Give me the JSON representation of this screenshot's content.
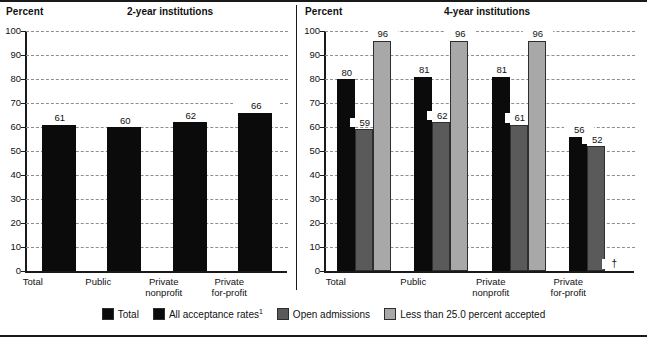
{
  "chart_data": {
    "type": "bar",
    "panels": [
      {
        "key": "two_year",
        "title": "2-year institutions",
        "ylabel": "Percent",
        "ylim": [
          0,
          100
        ],
        "ytick_step": 10,
        "yticks": [
          100,
          90,
          80,
          70,
          60,
          50,
          40,
          30,
          20,
          10,
          0
        ],
        "categories": [
          "Total",
          "Public",
          "Private\nnonprofit",
          "Private\nfor-profit"
        ],
        "series": [
          {
            "name": "Total",
            "color": "#0b0b0b",
            "values": [
              61,
              60,
              62,
              66
            ],
            "labels": [
              "61",
              "60",
              "62",
              "66"
            ]
          }
        ]
      },
      {
        "key": "four_year",
        "title": "4-year institutions",
        "ylabel": "Percent",
        "ylim": [
          0,
          100
        ],
        "ytick_step": 10,
        "yticks": [
          100,
          90,
          80,
          70,
          60,
          50,
          40,
          30,
          20,
          10,
          0
        ],
        "categories": [
          "Total",
          "Public",
          "Private\nnonprofit",
          "Private\nfor-profit"
        ],
        "series": [
          {
            "name": "All acceptance rates",
            "color": "#0b0b0b",
            "values": [
              80,
              81,
              81,
              56
            ],
            "labels": [
              "80",
              "81",
              "81",
              "56"
            ]
          },
          {
            "name": "Open admissions",
            "color": "#5a5a5a",
            "values": [
              59,
              62,
              61,
              52
            ],
            "labels": [
              "59",
              "62",
              "61",
              "52"
            ]
          },
          {
            "name": "Less than 25.0 percent accepted",
            "color": "#a8a8a8",
            "values": [
              96,
              96,
              96,
              null
            ],
            "labels": [
              "96",
              "96",
              "96",
              "†"
            ]
          }
        ]
      }
    ],
    "legend": {
      "position": "bottom",
      "entries": [
        {
          "label": "Total",
          "color": "#0b0b0b",
          "footnote": ""
        },
        {
          "label": "All acceptance rates",
          "color": "#0b0b0b",
          "footnote": "1"
        },
        {
          "label": "Open admissions",
          "color": "#5a5a5a",
          "footnote": ""
        },
        {
          "label": "Less than 25.0 percent accepted",
          "color": "#a8a8a8",
          "footnote": ""
        }
      ]
    },
    "symbols": {
      "not_applicable": "†"
    },
    "grid": true,
    "gridstyle": "dashed-horizontal"
  }
}
